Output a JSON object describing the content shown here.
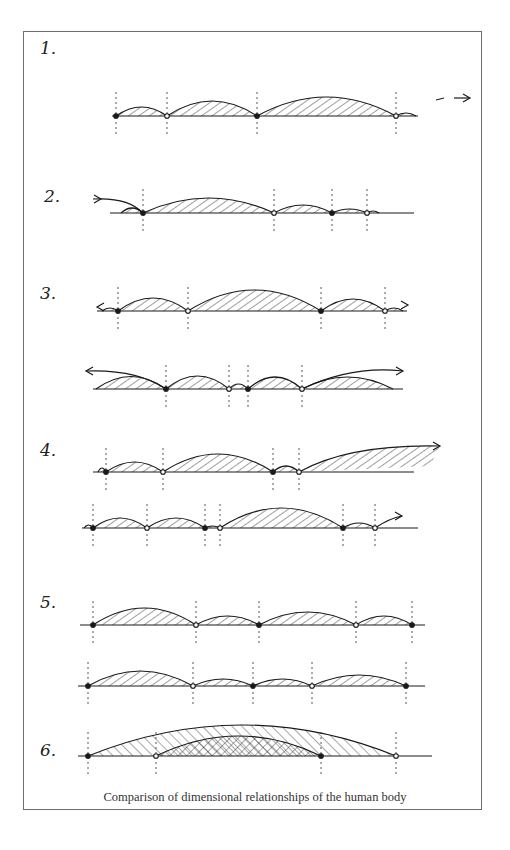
{
  "figure": {
    "caption": "Comparison of dimensional relationships of the human body",
    "stroke_color": "#1a1a1a",
    "hatch_color": "#2a2a2a",
    "frame_color": "#6e6e6e"
  },
  "diagrams": [
    {
      "label": "1.",
      "label_pos": [
        40,
        38
      ],
      "rows": [
        {
          "baseline_y": 116,
          "x_start": 112,
          "x_end": 418,
          "nodes": [
            116,
            167,
            257,
            396
          ],
          "heights": [
            9,
            15,
            19
          ],
          "arrow": "right-dashed",
          "arrow_end": 470
        }
      ]
    },
    {
      "label": "2.",
      "label_pos": [
        44,
        186
      ],
      "rows": [
        {
          "baseline_y": 213,
          "x_start": 110,
          "x_end": 414,
          "nodes": [
            143,
            274,
            332,
            367
          ],
          "heights": [
            15,
            8,
            4
          ],
          "arrow": "left-in",
          "arrow_start": 93
        }
      ]
    },
    {
      "label": "3.",
      "label_pos": [
        40,
        283
      ],
      "rows": [
        {
          "baseline_y": 311,
          "x_start": 97,
          "x_end": 407,
          "nodes": [
            118,
            188,
            321,
            385
          ],
          "heights": [
            13,
            21,
            12
          ],
          "arrow": "both"
        },
        {
          "baseline_y": 389,
          "x_start": 93,
          "x_end": 403,
          "nodes": [
            166,
            229,
            248,
            302
          ],
          "heights": [
            13,
            5,
            12
          ],
          "arrow": "both-wide",
          "left_tip": 86,
          "right_tip": 403,
          "outer_heights": [
            25,
            24
          ]
        }
      ]
    },
    {
      "label": "4.",
      "label_pos": [
        40,
        440
      ],
      "rows": [
        {
          "baseline_y": 472,
          "x_start": 93,
          "x_end": 414,
          "nodes": [
            106,
            163,
            273,
            299
          ],
          "heights": [
            10,
            18,
            6
          ],
          "arrow": "right-up",
          "right_tip": 440,
          "tail_height": 28
        },
        {
          "baseline_y": 528,
          "x_start": 82,
          "x_end": 418,
          "nodes": [
            93,
            147,
            205,
            220,
            343,
            375
          ],
          "heights": [
            10,
            10,
            2,
            20,
            5
          ],
          "arrow": "right-up-short",
          "right_tip": 402
        }
      ]
    },
    {
      "label": "5.",
      "label_pos": [
        40,
        592
      ],
      "rows": [
        {
          "baseline_y": 625,
          "x_start": 80,
          "x_end": 425,
          "nodes": [
            93,
            196,
            259,
            356,
            412
          ],
          "heights": [
            17,
            9,
            13,
            9
          ],
          "arrow": "none"
        },
        {
          "baseline_y": 686,
          "x_start": 78,
          "x_end": 425,
          "nodes": [
            88,
            193,
            253,
            312,
            406
          ],
          "heights": [
            15,
            7,
            7,
            11
          ],
          "arrow": "none"
        }
      ]
    },
    {
      "label": "6.",
      "label_pos": [
        40,
        740
      ],
      "rows": [
        {
          "baseline_y": 756,
          "x_start": 78,
          "x_end": 432,
          "nodes": [
            88,
            156,
            321,
            396
          ],
          "arcs": [
            {
              "from": 88,
              "to": 396,
              "height": 31,
              "hatch": "back"
            },
            {
              "from": 156,
              "to": 321,
              "height": 20,
              "hatch": "cross"
            }
          ],
          "arrow": "none"
        }
      ]
    }
  ]
}
